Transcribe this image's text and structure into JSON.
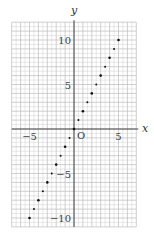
{
  "chart_data": {
    "type": "scatter",
    "title": "",
    "xlabel": "x",
    "ylabel": "y",
    "origin_label": "O",
    "xlim": [
      -7,
      7
    ],
    "ylim": [
      -11,
      12
    ],
    "grid": true,
    "grid_minor_step": 0.5,
    "x_ticks": [
      {
        "value": -5,
        "label": "−5"
      },
      {
        "value": 5,
        "label": "5"
      }
    ],
    "y_ticks": [
      {
        "value": 10,
        "label": "10"
      },
      {
        "value": 5,
        "label": "5"
      },
      {
        "value": -5,
        "label": "−5"
      },
      {
        "value": -10,
        "label": "−10"
      }
    ],
    "series": [
      {
        "name": "y = 2x",
        "x": [
          -5,
          -4.5,
          -4,
          -3.5,
          -3,
          -2.5,
          -2,
          -1.5,
          -1,
          -0.5,
          0,
          0.5,
          1,
          1.5,
          2,
          2.5,
          3,
          3.5,
          4,
          4.5,
          5
        ],
        "y": [
          -10,
          -9,
          -8,
          -7,
          -6,
          -5,
          -4,
          -3,
          -2,
          -1,
          0,
          1,
          2,
          3,
          4,
          5,
          6,
          7,
          8,
          9,
          10
        ]
      }
    ],
    "colors": {
      "grid": "#bbbbbb",
      "axis": "#333333",
      "point": "#111111"
    }
  }
}
